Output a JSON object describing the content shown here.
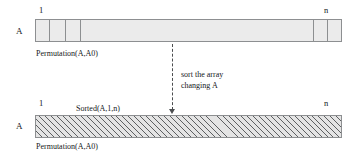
{
  "diagram": {
    "title_caption": "",
    "top_array": {
      "var_label": "A",
      "start_index": "1",
      "end_index": "n",
      "predicate": "Permutation(A,A0)",
      "state": "unsorted"
    },
    "bottom_array": {
      "var_label": "A",
      "start_index": "1",
      "end_index": "n",
      "top_predicate": "Sorted(A,1,n)",
      "predicate": "Permutation(A,A0)",
      "state": "sorted"
    },
    "transition": {
      "line1": "sort the array",
      "line2": "changing A",
      "arrow": "dashed-down-arrow"
    },
    "colors": {
      "outline": "#8d8f91",
      "unsorted_fill": "#ebebeb",
      "hatch_stroke": "#5d5f61",
      "arrow": "#4b4d4f",
      "text": "#15171a"
    }
  }
}
